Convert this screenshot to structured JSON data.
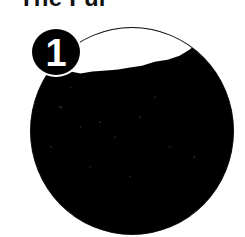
{
  "title": "The Fur",
  "badge": {
    "number": "1"
  },
  "illustration": {
    "description": "circular close-up photo of dark fur",
    "colors": {
      "fur": "#000000",
      "background": "#ffffff",
      "outline": "#111111"
    }
  }
}
